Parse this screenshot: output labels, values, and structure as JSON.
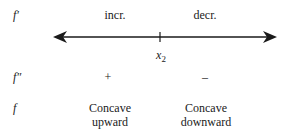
{
  "rows": {
    "fprime": {
      "label": "f′",
      "left": "incr.",
      "right": "decr."
    },
    "fdoubleprime": {
      "label": "f″",
      "left": "+",
      "right": "–"
    },
    "f": {
      "label": "f",
      "left_line1": "Concave",
      "left_line2": "upward",
      "right_line1": "Concave",
      "right_line2": "downward"
    }
  },
  "number_line": {
    "point_label": "x",
    "point_subscript": "2"
  }
}
